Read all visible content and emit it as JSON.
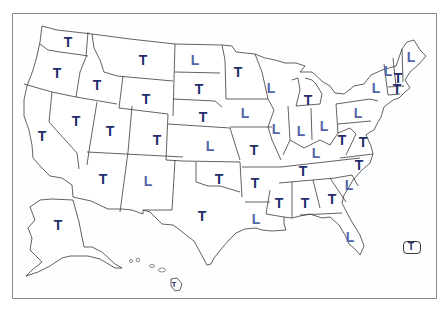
{
  "map": {
    "type": "us-state-map",
    "legend_codes": {
      "T": "T",
      "L": "L"
    },
    "colors": {
      "T": "#1f2d6b",
      "L": "#5165a8",
      "border": "#3a3a3a",
      "frame": "#8a8a8a"
    },
    "states": [
      {
        "state": "WA",
        "code": "T",
        "x": 68,
        "y": 42
      },
      {
        "state": "OR",
        "code": "T",
        "x": 57,
        "y": 73
      },
      {
        "state": "ID",
        "code": "T",
        "x": 97,
        "y": 85
      },
      {
        "state": "MT",
        "code": "T",
        "x": 143,
        "y": 60
      },
      {
        "state": "WY",
        "code": "T",
        "x": 146,
        "y": 99
      },
      {
        "state": "ND",
        "code": "L",
        "x": 195,
        "y": 60
      },
      {
        "state": "SD",
        "code": "T",
        "x": 199,
        "y": 89
      },
      {
        "state": "NE",
        "code": "T",
        "x": 203,
        "y": 117
      },
      {
        "state": "KS",
        "code": "L",
        "x": 210,
        "y": 146
      },
      {
        "state": "MN",
        "code": "T",
        "x": 238,
        "y": 72
      },
      {
        "state": "IA",
        "code": "L",
        "x": 245,
        "y": 113
      },
      {
        "state": "WI",
        "code": "L",
        "x": 271,
        "y": 88
      },
      {
        "state": "MI",
        "code": "T",
        "x": 308,
        "y": 100
      },
      {
        "state": "IL",
        "code": "L",
        "x": 276,
        "y": 129
      },
      {
        "state": "IN",
        "code": "L",
        "x": 301,
        "y": 131
      },
      {
        "state": "OH",
        "code": "L",
        "x": 324,
        "y": 126
      },
      {
        "state": "PA",
        "code": "L",
        "x": 358,
        "y": 113
      },
      {
        "state": "NY",
        "code": "L",
        "x": 376,
        "y": 88
      },
      {
        "state": "ME",
        "code": "L",
        "x": 411,
        "y": 57
      },
      {
        "state": "VT",
        "code": "L",
        "x": 388,
        "y": 71
      },
      {
        "state": "NH",
        "code": "T",
        "x": 398,
        "y": 78
      },
      {
        "state": "MA",
        "code": "T",
        "x": 397,
        "y": 89
      },
      {
        "state": "NV",
        "code": "T",
        "x": 76,
        "y": 121
      },
      {
        "state": "UT",
        "code": "T",
        "x": 110,
        "y": 131
      },
      {
        "state": "CO",
        "code": "T",
        "x": 157,
        "y": 140
      },
      {
        "state": "CA",
        "code": "T",
        "x": 42,
        "y": 136
      },
      {
        "state": "AZ",
        "code": "T",
        "x": 103,
        "y": 179
      },
      {
        "state": "NM",
        "code": "L",
        "x": 148,
        "y": 181
      },
      {
        "state": "OK",
        "code": "T",
        "x": 219,
        "y": 179
      },
      {
        "state": "TX",
        "code": "T",
        "x": 202,
        "y": 216
      },
      {
        "state": "MO",
        "code": "T",
        "x": 254,
        "y": 150
      },
      {
        "state": "AR",
        "code": "T",
        "x": 255,
        "y": 183
      },
      {
        "state": "LA",
        "code": "L",
        "x": 256,
        "y": 219
      },
      {
        "state": "MS",
        "code": "T",
        "x": 279,
        "y": 203
      },
      {
        "state": "AL",
        "code": "T",
        "x": 305,
        "y": 203
      },
      {
        "state": "GA",
        "code": "T",
        "x": 332,
        "y": 199
      },
      {
        "state": "SC",
        "code": "L",
        "x": 349,
        "y": 185
      },
      {
        "state": "NC",
        "code": "T",
        "x": 359,
        "y": 165
      },
      {
        "state": "TN",
        "code": "T",
        "x": 303,
        "y": 171
      },
      {
        "state": "KY",
        "code": "L",
        "x": 316,
        "y": 153
      },
      {
        "state": "WV",
        "code": "T",
        "x": 342,
        "y": 140
      },
      {
        "state": "VA",
        "code": "T",
        "x": 363,
        "y": 142
      },
      {
        "state": "FL",
        "code": "L",
        "x": 350,
        "y": 237
      },
      {
        "state": "AK",
        "code": "T",
        "x": 58,
        "y": 225
      },
      {
        "state": "HI",
        "code": "T",
        "x": 174,
        "y": 285,
        "size": "tiny"
      },
      {
        "state": "PR",
        "code": "T",
        "x": 411,
        "y": 247,
        "size": "small"
      }
    ]
  }
}
